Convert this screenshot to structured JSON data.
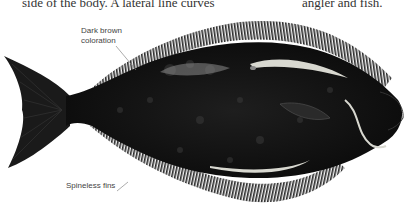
{
  "body_text": {
    "left_fragment": "side of the body. A lateral line curves",
    "right_fragment": "angler and fish."
  },
  "callouts": [
    {
      "id": "dark-brown",
      "lines": [
        "Dark brown",
        "coloration"
      ]
    },
    {
      "id": "fins",
      "lines": [
        "Spineless fins"
      ]
    }
  ],
  "illustration": {
    "subject": "halibut (flatfish), side view",
    "colors": {
      "body": "#111111",
      "fin": "#2a2a2a",
      "lateral_line": "#d8d8d0",
      "leader": "#888888"
    }
  }
}
